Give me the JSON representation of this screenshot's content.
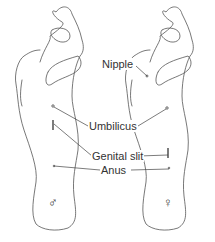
{
  "labels": {
    "nipple": "Nipple",
    "umbilicus": "Umbilicus",
    "genital_slit": "Genital slit",
    "anus": "Anus"
  },
  "symbols": {
    "male": "♂",
    "female": "♀"
  },
  "colors": {
    "outline": "#555555",
    "text": "#333333",
    "background": "#ffffff"
  }
}
